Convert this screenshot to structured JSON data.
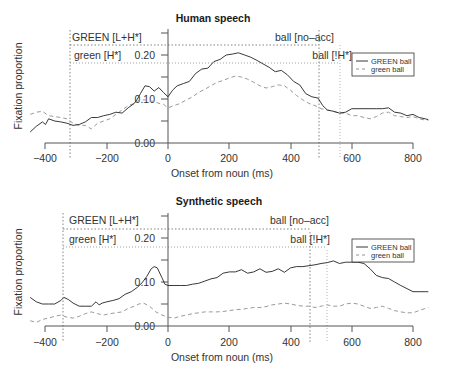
{
  "chart_data": [
    {
      "type": "line",
      "title": "Human speech",
      "xlabel": "Onset from noun (ms)",
      "ylabel": "Fixation proportion",
      "xlim": [
        -450,
        850
      ],
      "ylim": [
        0.0,
        0.25
      ],
      "xticks": [
        -400,
        -200,
        0,
        200,
        400,
        600,
        800
      ],
      "xtick_labels": [
        "−400",
        "−200",
        "0",
        "200",
        "400",
        "600",
        "800"
      ],
      "yticks": [
        0.0,
        0.05,
        0.1,
        0.15,
        0.2,
        0.25
      ],
      "ytick_labels": [
        "0.00",
        "",
        "0.10",
        "",
        "0.20",
        ""
      ],
      "grid": false,
      "legend_position": "upper right",
      "legend": [
        "GREEN ball",
        "green ball"
      ],
      "annotations": [
        {
          "text": "GREEN [L+H*]",
          "type": "hline",
          "y": 0.223,
          "x_from": -320,
          "x_to": 493,
          "style": "dotted"
        },
        {
          "text": "green [H*]",
          "type": "hline",
          "y": 0.182,
          "x_from": -320,
          "x_to": 562,
          "style": "dotted"
        },
        {
          "text": "ball [no-acc]",
          "type": "vline",
          "x": 493,
          "style": "dotted"
        },
        {
          "text": "ball [!H*]",
          "type": "vline",
          "x": 562,
          "style": "dotted"
        },
        {
          "text": "",
          "type": "vline",
          "x": -320,
          "style": "dotted"
        }
      ],
      "series": [
        {
          "name": "GREEN ball",
          "style": "solid",
          "color": "#222222",
          "x": [
            -450,
            -430,
            -410,
            -400,
            -390,
            -370,
            -350,
            -330,
            -310,
            -290,
            -270,
            -250,
            -230,
            -210,
            -190,
            -170,
            -150,
            -130,
            -110,
            -100,
            -90,
            -75,
            -60,
            -45,
            -30,
            -15,
            0,
            15,
            30,
            50,
            70,
            90,
            110,
            130,
            150,
            170,
            190,
            210,
            230,
            250,
            270,
            290,
            310,
            330,
            350,
            370,
            390,
            410,
            430,
            450,
            470,
            490,
            505,
            520,
            540,
            560,
            580,
            600,
            620,
            640,
            660,
            680,
            700,
            720,
            740,
            760,
            780,
            800,
            820,
            840,
            850
          ],
          "values": [
            0.025,
            0.038,
            0.048,
            0.042,
            0.055,
            0.05,
            0.048,
            0.045,
            0.04,
            0.042,
            0.048,
            0.058,
            0.058,
            0.062,
            0.065,
            0.07,
            0.068,
            0.08,
            0.09,
            0.1,
            0.112,
            0.13,
            0.128,
            0.118,
            0.126,
            0.115,
            0.105,
            0.12,
            0.13,
            0.135,
            0.14,
            0.158,
            0.168,
            0.17,
            0.185,
            0.19,
            0.2,
            0.202,
            0.205,
            0.2,
            0.195,
            0.188,
            0.18,
            0.172,
            0.162,
            0.165,
            0.155,
            0.14,
            0.132,
            0.112,
            0.105,
            0.102,
            0.085,
            0.075,
            0.072,
            0.068,
            0.07,
            0.078,
            0.078,
            0.078,
            0.078,
            0.078,
            0.078,
            0.08,
            0.07,
            0.068,
            0.062,
            0.065,
            0.058,
            0.055,
            0.053
          ]
        },
        {
          "name": "green ball",
          "style": "dashed",
          "color": "#999999",
          "x": [
            -450,
            -430,
            -410,
            -390,
            -370,
            -350,
            -330,
            -310,
            -290,
            -270,
            -250,
            -230,
            -210,
            -190,
            -170,
            -150,
            -130,
            -110,
            -100,
            -90,
            -75,
            -60,
            -45,
            -30,
            -15,
            0,
            20,
            40,
            60,
            80,
            100,
            120,
            140,
            160,
            180,
            200,
            220,
            240,
            260,
            280,
            300,
            320,
            340,
            360,
            380,
            400,
            420,
            440,
            460,
            480,
            500,
            520,
            540,
            560,
            580,
            600,
            620,
            640,
            660,
            680,
            700,
            720,
            740,
            760,
            780,
            800,
            820,
            840,
            850
          ],
          "values": [
            0.065,
            0.07,
            0.072,
            0.062,
            0.06,
            0.058,
            0.055,
            0.045,
            0.04,
            0.04,
            0.032,
            0.045,
            0.05,
            0.055,
            0.065,
            0.075,
            0.085,
            0.09,
            0.095,
            0.098,
            0.098,
            0.095,
            0.095,
            0.09,
            0.088,
            0.08,
            0.085,
            0.09,
            0.098,
            0.105,
            0.115,
            0.122,
            0.13,
            0.138,
            0.142,
            0.148,
            0.152,
            0.15,
            0.145,
            0.138,
            0.13,
            0.125,
            0.128,
            0.132,
            0.13,
            0.12,
            0.108,
            0.098,
            0.09,
            0.085,
            0.078,
            0.075,
            0.072,
            0.068,
            0.068,
            0.062,
            0.062,
            0.058,
            0.055,
            0.06,
            0.068,
            0.07,
            0.062,
            0.06,
            0.058,
            0.06,
            0.055,
            0.052,
            0.052
          ]
        }
      ]
    },
    {
      "type": "line",
      "title": "Synthetic speech",
      "xlabel": "Onset from noun (ms)",
      "ylabel": "Fixation proportion",
      "xlim": [
        -450,
        850
      ],
      "ylim": [
        0.0,
        0.25
      ],
      "xticks": [
        -400,
        -200,
        0,
        200,
        400,
        600,
        800
      ],
      "xtick_labels": [
        "−400",
        "−200",
        "0",
        "200",
        "400",
        "600",
        "800"
      ],
      "yticks": [
        0.0,
        0.05,
        0.1,
        0.15,
        0.2,
        0.25
      ],
      "ytick_labels": [
        "0.00",
        "",
        "0.10",
        "",
        "0.20",
        ""
      ],
      "grid": false,
      "legend_position": "upper right",
      "legend": [
        "GREEN ball",
        "green ball"
      ],
      "annotations": [
        {
          "text": "GREEN [L+H*]",
          "type": "hline",
          "y": 0.22,
          "x_from": -343,
          "x_to": 464,
          "style": "dotted"
        },
        {
          "text": "green [H*]",
          "type": "hline",
          "y": 0.18,
          "x_from": -343,
          "x_to": 519,
          "style": "dotted"
        },
        {
          "text": "ball [no-acc]",
          "type": "vline",
          "x": 464,
          "style": "dotted"
        },
        {
          "text": "ball [!H*]",
          "type": "vline",
          "x": 519,
          "style": "dotted"
        },
        {
          "text": "",
          "type": "vline",
          "x": -343,
          "style": "dotted"
        }
      ],
      "series": [
        {
          "name": "GREEN ball",
          "style": "solid",
          "color": "#222222",
          "x": [
            -450,
            -430,
            -410,
            -390,
            -370,
            -350,
            -340,
            -325,
            -310,
            -290,
            -270,
            -250,
            -235,
            -225,
            -215,
            -200,
            -180,
            -160,
            -140,
            -120,
            -100,
            -85,
            -70,
            -55,
            -45,
            -35,
            -20,
            -10,
            0,
            20,
            40,
            60,
            80,
            100,
            120,
            140,
            160,
            180,
            200,
            220,
            240,
            260,
            280,
            300,
            320,
            340,
            360,
            380,
            400,
            420,
            440,
            460,
            480,
            500,
            520,
            540,
            560,
            580,
            600,
            620,
            640,
            660,
            680,
            700,
            720,
            740,
            760,
            780,
            800,
            820,
            840,
            850
          ],
          "values": [
            0.065,
            0.055,
            0.05,
            0.05,
            0.05,
            0.058,
            0.065,
            0.06,
            0.052,
            0.045,
            0.045,
            0.045,
            0.055,
            0.048,
            0.052,
            0.055,
            0.058,
            0.062,
            0.072,
            0.078,
            0.088,
            0.098,
            0.112,
            0.13,
            0.135,
            0.132,
            0.11,
            0.095,
            0.092,
            0.092,
            0.092,
            0.092,
            0.095,
            0.097,
            0.102,
            0.107,
            0.11,
            0.12,
            0.123,
            0.123,
            0.128,
            0.12,
            0.123,
            0.13,
            0.122,
            0.124,
            0.13,
            0.122,
            0.132,
            0.135,
            0.135,
            0.137,
            0.139,
            0.142,
            0.144,
            0.148,
            0.142,
            0.145,
            0.145,
            0.145,
            0.142,
            0.13,
            0.115,
            0.11,
            0.108,
            0.1,
            0.092,
            0.085,
            0.078,
            0.078,
            0.078,
            0.078,
            0.076,
            0.072
          ]
        },
        {
          "name": "green ball",
          "style": "dashed",
          "color": "#999999",
          "x": [
            -450,
            -430,
            -410,
            -390,
            -370,
            -350,
            -330,
            -310,
            -290,
            -270,
            -250,
            -230,
            -210,
            -190,
            -170,
            -150,
            -130,
            -110,
            -95,
            -80,
            -60,
            -40,
            -20,
            0,
            20,
            40,
            60,
            80,
            100,
            120,
            140,
            160,
            180,
            200,
            220,
            240,
            260,
            280,
            300,
            320,
            340,
            360,
            380,
            400,
            420,
            440,
            460,
            480,
            500,
            520,
            540,
            560,
            580,
            600,
            620,
            640,
            660,
            680,
            700,
            720,
            740,
            760,
            780,
            800,
            820,
            840,
            850
          ],
          "values": [
            0.012,
            0.008,
            0.015,
            0.018,
            0.022,
            0.025,
            0.02,
            0.018,
            0.022,
            0.028,
            0.032,
            0.028,
            0.025,
            0.028,
            0.03,
            0.032,
            0.04,
            0.045,
            0.05,
            0.052,
            0.045,
            0.032,
            0.025,
            0.02,
            0.018,
            0.022,
            0.025,
            0.028,
            0.03,
            0.032,
            0.032,
            0.032,
            0.033,
            0.035,
            0.037,
            0.038,
            0.04,
            0.042,
            0.042,
            0.044,
            0.048,
            0.05,
            0.052,
            0.05,
            0.047,
            0.045,
            0.045,
            0.042,
            0.045,
            0.048,
            0.045,
            0.045,
            0.05,
            0.052,
            0.05,
            0.045,
            0.04,
            0.042,
            0.045,
            0.04,
            0.035,
            0.032,
            0.03,
            0.03,
            0.035,
            0.04,
            0.042
          ]
        }
      ]
    }
  ],
  "charts": [
    {
      "title": "Human speech",
      "ylabel": "Fixation proportion",
      "xlabel": "Onset from noun (ms)",
      "annot_green_lh": "GREEN [L+H*]",
      "annot_green_h": "green [H*]",
      "annot_ball_noacc": "ball [no–acc]",
      "annot_ball_h": "ball [!H*]",
      "ytick_000": "0.00",
      "ytick_010": "0.10",
      "ytick_020": "0.20",
      "xticks": [
        "−400",
        "−200",
        "0",
        "200",
        "400",
        "600",
        "800"
      ],
      "legend": {
        "solid": "GREEN ball",
        "dashed": "green ball"
      }
    },
    {
      "title": "Synthetic speech",
      "ylabel": "Fixation proportion",
      "xlabel": "Onset from noun (ms)",
      "annot_green_lh": "GREEN [L+H*]",
      "annot_green_h": "green [H*]",
      "annot_ball_noacc": "ball [no–acc]",
      "annot_ball_h": "ball [!H*]",
      "ytick_000": "0.00",
      "ytick_010": "0.10",
      "ytick_020": "0.20",
      "xticks": [
        "−400",
        "−200",
        "0",
        "200",
        "400",
        "600",
        "800"
      ],
      "legend": {
        "solid": "GREEN ball",
        "dashed": "green ball"
      }
    }
  ],
  "colors": {
    "axis": "#555555",
    "solid_series": "#222222",
    "dashed_series": "#9a9a9a",
    "annotation_line": "#777777"
  }
}
